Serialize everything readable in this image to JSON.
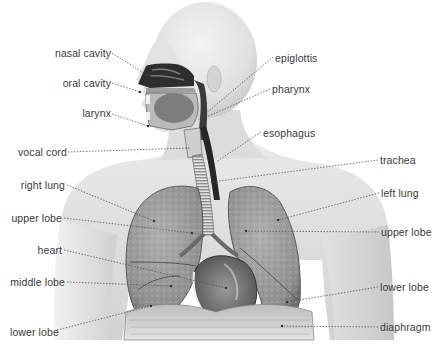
{
  "diagram": {
    "labels_left": [
      {
        "id": "nasal-cavity",
        "text": "nasal cavity"
      },
      {
        "id": "oral-cavity",
        "text": "oral cavity"
      },
      {
        "id": "larynx",
        "text": "larynx"
      },
      {
        "id": "vocal-cord",
        "text": "vocal cord"
      },
      {
        "id": "right-lung",
        "text": "right lung"
      },
      {
        "id": "upper-lobe-right-lung",
        "text": "upper lobe"
      },
      {
        "id": "heart",
        "text": "heart"
      },
      {
        "id": "middle-lobe",
        "text": "middle lobe"
      },
      {
        "id": "lower-lobe-right-lung",
        "text": "lower lobe"
      }
    ],
    "labels_right": [
      {
        "id": "epiglottis",
        "text": "epiglottis"
      },
      {
        "id": "pharynx",
        "text": "pharynx"
      },
      {
        "id": "esophagus",
        "text": "esophagus"
      },
      {
        "id": "trachea",
        "text": "trachea"
      },
      {
        "id": "left-lung",
        "text": "left lung"
      },
      {
        "id": "upper-lobe-left-lung",
        "text": "upper lobe"
      },
      {
        "id": "lower-lobe-left-lung",
        "text": "lower lobe"
      },
      {
        "id": "diaphragm",
        "text": "diaphragm"
      }
    ],
    "colors": {
      "background": "#ffffff",
      "skin_light": "#eeeeee",
      "skin_mid": "#d6d6d6",
      "lung_fill": "#9a9a9a",
      "lung_edge": "#5a5a5a",
      "airway_dark": "#2b2b2b",
      "label_text": "#3a3a3a",
      "leader_line": "#555555"
    }
  }
}
